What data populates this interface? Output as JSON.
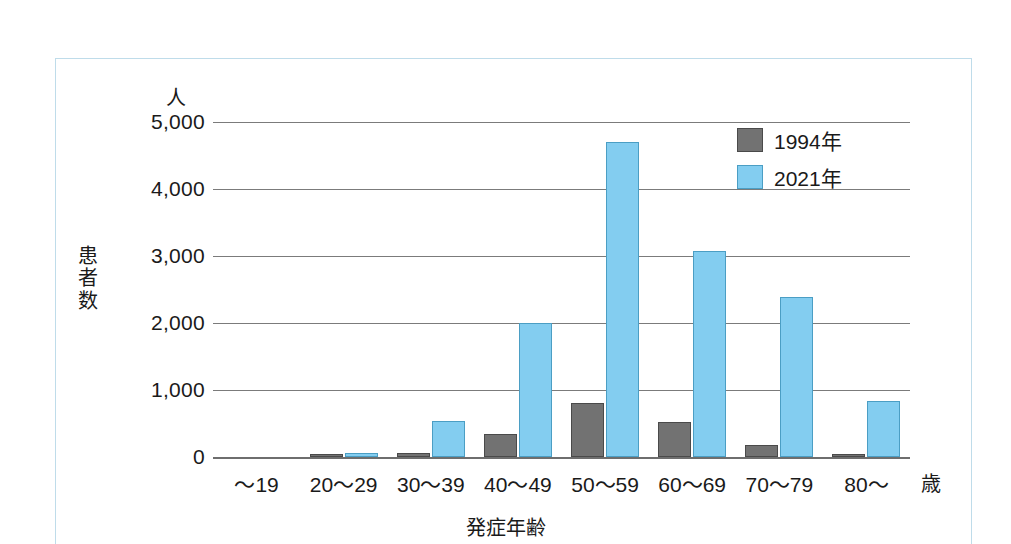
{
  "chart_data": {
    "type": "bar",
    "title": "",
    "xlabel": "発症年齢",
    "ylabel": "患者数",
    "y_unit": "人",
    "x_unit": "歳",
    "categories": [
      "〜19",
      "20〜29",
      "30〜39",
      "40〜49",
      "50〜59",
      "60〜69",
      "70〜79",
      "80〜"
    ],
    "series": [
      {
        "name": "1994年",
        "color": "#727272",
        "values": [
          0,
          20,
          60,
          350,
          800,
          520,
          180,
          30
        ]
      },
      {
        "name": "2021年",
        "color": "#83cdf0",
        "values": [
          0,
          60,
          540,
          2000,
          4700,
          3080,
          2390,
          840
        ]
      }
    ],
    "yticks": [
      {
        "value": 5000,
        "label": "5,000"
      },
      {
        "value": 4000,
        "label": "4,000"
      },
      {
        "value": 3000,
        "label": "3,000"
      },
      {
        "value": 2000,
        "label": "2,000"
      },
      {
        "value": 1000,
        "label": "1,000"
      },
      {
        "value": 0,
        "label": "0"
      }
    ],
    "ylim": [
      0,
      5000
    ],
    "grid": true,
    "legend_position": "top-right"
  },
  "legend": {
    "entries": [
      {
        "label": "1994年"
      },
      {
        "label": "2021年"
      }
    ]
  }
}
